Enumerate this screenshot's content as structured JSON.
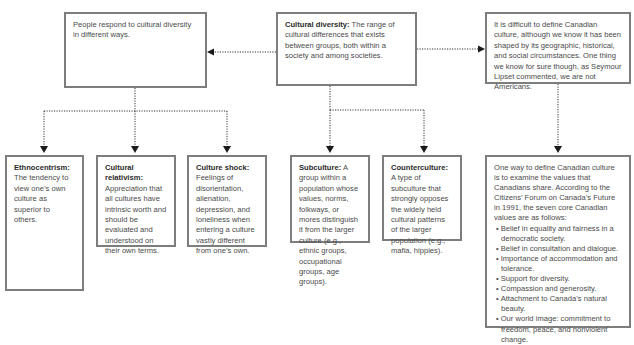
{
  "diagram": {
    "top": {
      "left": {
        "text": "People respond to cultural diversity in different ways."
      },
      "center": {
        "term": "Cultural diversity:",
        "definition": " The range of cultural differences that exists between groups, both within a society and among societies."
      },
      "right": {
        "text": "It is difficult to define Canadian culture, although we know it has been shaped by its geographic, historical, and social circumstances. One thing we know for sure though, as Seymour Lipset commented, we are not Americans."
      }
    },
    "responses": [
      {
        "term": "Ethnocentrism:",
        "definition": " The tendency to view one’s own culture as superior to others."
      },
      {
        "term": "Cultural relativism:",
        "definition": " Appreciation that all cultures have intrinsic worth and should be evaluated and understood on their own terms."
      },
      {
        "term": "Culture shock:",
        "definition": " Feelings of disorientation, alienation, depression, and loneliness when entering a culture vastly different from one’s own."
      }
    ],
    "diversity_types": [
      {
        "term": "Subculture:",
        "definition": " A group within a population whose values, norms, folkways, or mores distinguish it from the larger culture (e.g., ethnic groups, occupational groups, age groups)."
      },
      {
        "term": "Counterculture:",
        "definition": " A type of subculture that strongly opposes the widely held cultural patterns of the larger population (e.g., mafia, hippies)."
      }
    ],
    "canadian_values": {
      "intro": "One way to define Canadian culture is to examine the values that Canadians share. According to the Citizens’ Forum on Canada’s Future in 1991, the seven core Canadian values are as follows:",
      "items": [
        "Belief in equality and fairness in a democratic society.",
        "Belief in consultation and dialogue.",
        "Importance of accommodation and tolerance.",
        "Support for diversity.",
        "Compassion and generosity.",
        "Attachment to Canada’s natural beauty.",
        "Our world image: commitment to freedom, peace, and nonviolent change."
      ]
    }
  },
  "colors": {
    "border": "#7d7d7d",
    "connector": "#333333",
    "text": "#4a4a4a"
  }
}
